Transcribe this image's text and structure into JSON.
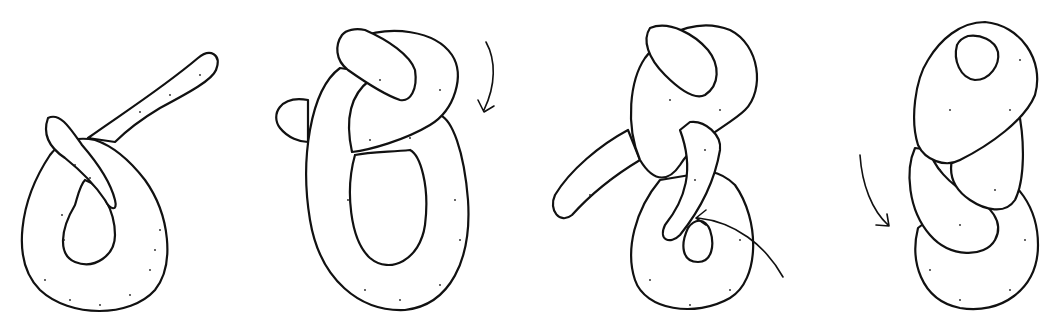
{
  "figure": {
    "title": "Shaping a dough knot",
    "colors": {
      "ink": "#111111",
      "background": "#ffffff",
      "stipple": "#222222"
    },
    "steps": [
      {
        "index": 1,
        "label": "Form a loop, crossing one end over",
        "arrow": "none"
      },
      {
        "index": 2,
        "label": "Wrap the long end over and around the loop",
        "arrow": "arrow-clockwise-down"
      },
      {
        "index": 3,
        "label": "Tuck the end up through the lower loop",
        "arrow": "arrow-through-loop"
      },
      {
        "index": 4,
        "label": "Finished twisted knot",
        "arrow": "arrow-curved-down"
      }
    ]
  }
}
